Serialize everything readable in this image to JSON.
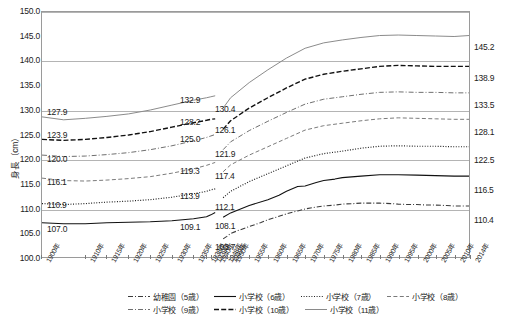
{
  "chart_data": {
    "type": "line",
    "title": "",
    "xlabel": "",
    "ylabel": "身長（cm）",
    "ylim": [
      100.0,
      150.0
    ],
    "ytick_step": 5.0,
    "yticks": [
      "150.0",
      "145.0",
      "140.0",
      "135.0",
      "130.0",
      "125.0",
      "120.0",
      "115.0",
      "110.0",
      "105.0",
      "100.0"
    ],
    "grid": true,
    "legend_position": "bottom",
    "gap_note": "データ欠損（戦中期）",
    "xticks": [
      "1900年",
      "1910年",
      "1915年",
      "1920年",
      "1925年",
      "1930年",
      "1935年",
      "1938年",
      "1939年",
      "1940年",
      "1948年",
      "1949年",
      "1950年",
      "1955年",
      "1960年",
      "1965年",
      "1970年",
      "1975年",
      "1980年",
      "1985年",
      "1990年",
      "1995年",
      "2000年",
      "2005年",
      "2010年",
      "2014年"
    ],
    "series": [
      {
        "name": "幼稚園（5歳）",
        "style": "dash-dot",
        "color": "#3b3b3b",
        "start_label": "",
        "pre_gap_label": "",
        "post_gap_label": "103.7",
        "end_label": "110.4",
        "x": [
          1948,
          1949,
          1950,
          1952,
          1955,
          1958,
          1960,
          1963,
          1965,
          1968,
          1970,
          1973,
          1975,
          1978,
          1980,
          1983,
          1985,
          1988,
          1990,
          1993,
          1995,
          1998,
          2000,
          2003,
          2005,
          2008,
          2010,
          2012,
          2014
        ],
        "y": [
          103.7,
          104.2,
          104.8,
          105.4,
          106.2,
          107.0,
          107.6,
          108.3,
          108.8,
          109.4,
          109.8,
          110.2,
          110.4,
          110.6,
          110.8,
          110.9,
          111.0,
          111.0,
          111.0,
          110.9,
          110.8,
          110.7,
          110.7,
          110.6,
          110.6,
          110.5,
          110.4,
          110.4,
          110.4
        ]
      },
      {
        "name": "小学校（6歳）",
        "style": "solid",
        "color": "#111111",
        "start_label": "107.0",
        "pre_gap_label": "109.1",
        "post_gap_label": "108.1",
        "end_label": "116.5",
        "x_pre": [
          1900,
          1905,
          1910,
          1915,
          1920,
          1925,
          1930,
          1935,
          1938,
          1939,
          1940
        ],
        "y_pre": [
          107.0,
          106.8,
          106.8,
          107.0,
          107.1,
          107.2,
          107.4,
          107.8,
          108.2,
          108.6,
          109.1
        ],
        "x_post": [
          1948,
          1950,
          1955,
          1960,
          1963,
          1965,
          1968,
          1970,
          1973,
          1975,
          1978,
          1980,
          1985,
          1990,
          1995,
          2000,
          2005,
          2010,
          2014
        ],
        "y_post": [
          108.1,
          109.0,
          110.5,
          111.7,
          112.6,
          113.4,
          114.4,
          114.5,
          115.2,
          115.6,
          115.9,
          116.2,
          116.5,
          116.8,
          116.8,
          116.7,
          116.6,
          116.5,
          116.5
        ]
      },
      {
        "name": "小学校（7歳）",
        "style": "dotted",
        "color": "#222222",
        "start_label": "110.9",
        "pre_gap_label": "113.9",
        "post_gap_label": "112.1",
        "end_label": "122.5",
        "x_pre": [
          1900,
          1905,
          1910,
          1915,
          1920,
          1925,
          1930,
          1935,
          1938,
          1939,
          1940
        ],
        "y_pre": [
          110.9,
          110.7,
          110.9,
          111.2,
          111.4,
          111.7,
          112.2,
          112.9,
          113.4,
          113.7,
          113.9
        ],
        "x_post": [
          1948,
          1950,
          1955,
          1960,
          1965,
          1970,
          1975,
          1980,
          1985,
          1990,
          1995,
          2000,
          2005,
          2010,
          2014
        ],
        "y_post": [
          112.1,
          113.4,
          115.4,
          117.0,
          118.6,
          120.2,
          121.1,
          121.6,
          122.2,
          122.6,
          122.7,
          122.6,
          122.6,
          122.5,
          122.5
        ]
      },
      {
        "name": "小学校（8歳）",
        "style": "dashed-light",
        "color": "#7a7a7a",
        "start_label": "116.1",
        "pre_gap_label": "119.3",
        "post_gap_label": "117.4",
        "end_label": "128.1",
        "x_pre": [
          1900,
          1905,
          1910,
          1915,
          1920,
          1925,
          1930,
          1935,
          1938,
          1939,
          1940
        ],
        "y_pre": [
          116.1,
          115.6,
          115.5,
          115.7,
          116.0,
          116.4,
          117.1,
          118.0,
          118.7,
          119.0,
          119.3
        ],
        "x_post": [
          1948,
          1950,
          1955,
          1960,
          1965,
          1970,
          1975,
          1980,
          1985,
          1990,
          1995,
          2000,
          2005,
          2010,
          2014
        ],
        "y_post": [
          117.4,
          118.8,
          120.8,
          122.5,
          124.2,
          125.9,
          126.8,
          127.3,
          127.8,
          128.2,
          128.4,
          128.3,
          128.2,
          128.1,
          128.1
        ]
      },
      {
        "name": "小学校（9歳）",
        "style": "dash-dot-light",
        "color": "#6e6e6e",
        "start_label": "123.9",
        "pre_gap_label": "125.0",
        "post_gap_label": "121.9",
        "end_label": "133.5",
        "x_pre": [
          1900,
          1905,
          1910,
          1915,
          1920,
          1925,
          1930,
          1935,
          1938,
          1939,
          1940
        ],
        "y_pre": [
          120.8,
          120.5,
          120.6,
          120.9,
          121.3,
          121.9,
          122.7,
          123.7,
          124.4,
          124.7,
          125.0
        ],
        "x_post": [
          1948,
          1950,
          1955,
          1960,
          1965,
          1970,
          1975,
          1980,
          1985,
          1990,
          1995,
          2000,
          2005,
          2010,
          2014
        ],
        "y_post": [
          121.9,
          123.5,
          125.8,
          127.7,
          129.5,
          131.2,
          132.2,
          132.7,
          133.2,
          133.6,
          133.7,
          133.6,
          133.6,
          133.5,
          133.5
        ]
      },
      {
        "name": "小学校（10歳）",
        "style": "dashed-heavy",
        "color": "#111111",
        "start_label": "127.9",
        "pre_gap_label": "128.2",
        "post_gap_label": "126.1",
        "end_label": "138.9",
        "x_pre": [
          1900,
          1905,
          1910,
          1915,
          1920,
          1925,
          1930,
          1935,
          1938,
          1939,
          1940
        ],
        "y_pre": [
          124.0,
          123.8,
          124.0,
          124.4,
          124.9,
          125.6,
          126.5,
          127.4,
          127.9,
          128.1,
          128.2
        ],
        "x_post": [
          1948,
          1950,
          1955,
          1960,
          1965,
          1970,
          1975,
          1980,
          1985,
          1990,
          1995,
          2000,
          2005,
          2010,
          2014
        ],
        "y_post": [
          126.1,
          127.8,
          130.4,
          132.5,
          134.5,
          136.3,
          137.3,
          137.9,
          138.4,
          138.9,
          139.1,
          139.0,
          138.9,
          138.9,
          138.9
        ]
      },
      {
        "name": "小学校（11歳）",
        "style": "solid-light",
        "color": "#8a8a8a",
        "start_label": "120.0",
        "pre_gap_label": "132.9",
        "post_gap_label": "130.4",
        "end_label": "145.2",
        "x_pre": [
          1900,
          1905,
          1910,
          1915,
          1920,
          1925,
          1930,
          1935,
          1938,
          1939,
          1940
        ],
        "y_pre": [
          128.6,
          128.0,
          128.3,
          128.7,
          129.2,
          130.0,
          131.0,
          132.0,
          132.5,
          132.7,
          132.9
        ],
        "x_post": [
          1948,
          1950,
          1955,
          1960,
          1965,
          1970,
          1975,
          1980,
          1985,
          1990,
          1995,
          2000,
          2005,
          2010,
          2014
        ],
        "y_post": [
          130.4,
          132.5,
          135.6,
          138.2,
          140.6,
          142.6,
          143.7,
          144.3,
          144.8,
          145.2,
          145.3,
          145.2,
          145.1,
          145.0,
          145.2
        ]
      }
    ],
    "value_labels_left": [
      {
        "text": "127.9",
        "x": 47,
        "y": 108
      },
      {
        "text": "123.9",
        "x": 47,
        "y": 131
      },
      {
        "text": "120.0",
        "x": 47,
        "y": 155
      },
      {
        "text": "116.1",
        "x": 47,
        "y": 178
      },
      {
        "text": "110.9",
        "x": 47,
        "y": 201
      },
      {
        "text": "107.0",
        "x": 47,
        "y": 225
      }
    ],
    "value_labels_mid_pre": [
      {
        "text": "132.9",
        "x": 180,
        "y": 96
      },
      {
        "text": "128.2",
        "x": 180,
        "y": 118
      },
      {
        "text": "125.0",
        "x": 180,
        "y": 135
      },
      {
        "text": "119.3",
        "x": 180,
        "y": 167
      },
      {
        "text": "113.9",
        "x": 180,
        "y": 192
      },
      {
        "text": "109.1",
        "x": 180,
        "y": 223
      }
    ],
    "value_labels_mid_post": [
      {
        "text": "130.4",
        "x": 215,
        "y": 105
      },
      {
        "text": "126.1",
        "x": 215,
        "y": 126
      },
      {
        "text": "121.9",
        "x": 215,
        "y": 150
      },
      {
        "text": "117.4",
        "x": 215,
        "y": 172
      },
      {
        "text": "112.1",
        "x": 215,
        "y": 203
      },
      {
        "text": "108.1",
        "x": 215,
        "y": 222
      },
      {
        "text": "103.7",
        "x": 215,
        "y": 243
      }
    ],
    "value_labels_right": [
      {
        "text": "145.2",
        "x": 474,
        "y": 43
      },
      {
        "text": "138.9",
        "x": 474,
        "y": 74
      },
      {
        "text": "133.5",
        "x": 474,
        "y": 101
      },
      {
        "text": "128.1",
        "x": 474,
        "y": 128
      },
      {
        "text": "122.5",
        "x": 474,
        "y": 156
      },
      {
        "text": "116.5",
        "x": 474,
        "y": 186
      },
      {
        "text": "110.4",
        "x": 474,
        "y": 216
      }
    ]
  },
  "legend": {
    "rows": [
      [
        {
          "label": "幼稚園（5歳）",
          "style": "dash-dot"
        },
        {
          "label": "小学校（6歳）",
          "style": "solid"
        },
        {
          "label": "小学校（7歳）",
          "style": "dotted"
        },
        {
          "label": "小学校（8歳）",
          "style": "dashed-light"
        }
      ],
      [
        {
          "label": "小学校（9歳）",
          "style": "dash-dot-light"
        },
        {
          "label": "小学校（10歳）",
          "style": "dashed-heavy"
        },
        {
          "label": "小学校（11歳）",
          "style": "solid-light"
        }
      ]
    ]
  }
}
